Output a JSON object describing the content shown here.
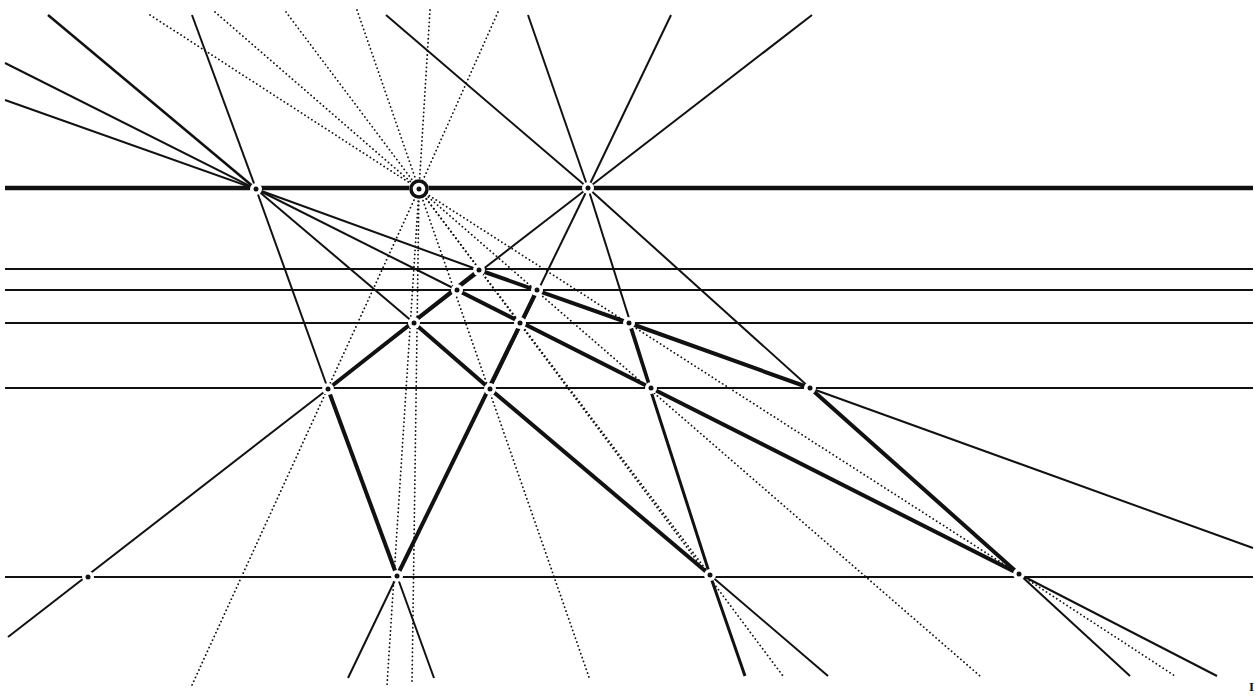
{
  "diagram": {
    "stroke_color": "#111111",
    "background": "#ffffff",
    "corner_mark": "I",
    "horizontals": [
      {
        "y": 188,
        "x1": 5,
        "x2": 1253,
        "w": 4.5
      },
      {
        "y": 269,
        "x1": 5,
        "x2": 1253,
        "w": 2
      },
      {
        "y": 290,
        "x1": 5,
        "x2": 1253,
        "w": 2
      },
      {
        "y": 323,
        "x1": 5,
        "x2": 1253,
        "w": 2
      },
      {
        "y": 388,
        "x1": 5,
        "x2": 1253,
        "w": 2
      },
      {
        "y": 577,
        "x1": 5,
        "x2": 1253,
        "w": 2
      }
    ],
    "points": [
      {
        "name": "vp-left",
        "x": 256,
        "y": 189
      },
      {
        "name": "vp-center",
        "x": 419,
        "y": 189,
        "ring": true
      },
      {
        "name": "vp-right",
        "x": 588,
        "y": 188
      },
      {
        "name": "p1",
        "x": 479,
        "y": 270
      },
      {
        "name": "p2",
        "x": 537,
        "y": 290
      },
      {
        "name": "p3",
        "x": 457,
        "y": 290
      },
      {
        "name": "p4",
        "x": 414,
        "y": 323
      },
      {
        "name": "p5",
        "x": 520,
        "y": 323
      },
      {
        "name": "p6",
        "x": 629,
        "y": 323
      },
      {
        "name": "p7",
        "x": 328,
        "y": 389
      },
      {
        "name": "p8",
        "x": 490,
        "y": 389
      },
      {
        "name": "p9",
        "x": 651,
        "y": 388
      },
      {
        "name": "p10",
        "x": 810,
        "y": 388
      },
      {
        "name": "b1",
        "x": 88,
        "y": 577
      },
      {
        "name": "b2",
        "x": 397,
        "y": 576
      },
      {
        "name": "b3",
        "x": 710,
        "y": 575
      },
      {
        "name": "b4",
        "x": 1019,
        "y": 574
      }
    ],
    "solid_lines": [
      {
        "x1": 48,
        "y1": 15,
        "x2": 256,
        "y2": 189,
        "w": 2.5
      },
      {
        "x1": 5,
        "y1": 63,
        "x2": 256,
        "y2": 189,
        "w": 2
      },
      {
        "x1": 5,
        "y1": 100,
        "x2": 256,
        "y2": 189,
        "w": 2
      },
      {
        "x1": 192,
        "y1": 15,
        "x2": 256,
        "y2": 189,
        "w": 2
      },
      {
        "x1": 256,
        "y1": 189,
        "x2": 479,
        "y2": 270,
        "w": 2
      },
      {
        "x1": 256,
        "y1": 189,
        "x2": 457,
        "y2": 290,
        "w": 2
      },
      {
        "x1": 256,
        "y1": 189,
        "x2": 414,
        "y2": 323,
        "w": 2
      },
      {
        "x1": 256,
        "y1": 189,
        "x2": 328,
        "y2": 389,
        "w": 2
      },
      {
        "x1": 386,
        "y1": 15,
        "x2": 588,
        "y2": 188,
        "w": 2
      },
      {
        "x1": 528,
        "y1": 15,
        "x2": 588,
        "y2": 188,
        "w": 2
      },
      {
        "x1": 671,
        "y1": 15,
        "x2": 588,
        "y2": 188,
        "w": 2
      },
      {
        "x1": 812,
        "y1": 15,
        "x2": 588,
        "y2": 188,
        "w": 2
      },
      {
        "x1": 588,
        "y1": 188,
        "x2": 328,
        "y2": 389,
        "w": 2
      },
      {
        "x1": 588,
        "y1": 188,
        "x2": 490,
        "y2": 389,
        "w": 2
      },
      {
        "x1": 588,
        "y1": 188,
        "x2": 651,
        "y2": 388,
        "w": 2
      },
      {
        "x1": 588,
        "y1": 188,
        "x2": 810,
        "y2": 388,
        "w": 2
      },
      {
        "x1": 479,
        "y1": 270,
        "x2": 629,
        "y2": 323,
        "w": 4
      },
      {
        "x1": 629,
        "y1": 323,
        "x2": 810,
        "y2": 388,
        "w": 4
      },
      {
        "x1": 457,
        "y1": 290,
        "x2": 651,
        "y2": 388,
        "w": 4
      },
      {
        "x1": 414,
        "y1": 323,
        "x2": 490,
        "y2": 389,
        "w": 4
      },
      {
        "x1": 490,
        "y1": 389,
        "x2": 710,
        "y2": 575,
        "w": 4
      },
      {
        "x1": 651,
        "y1": 388,
        "x2": 1019,
        "y2": 574,
        "w": 4
      },
      {
        "x1": 810,
        "y1": 388,
        "x2": 1019,
        "y2": 574,
        "w": 4
      },
      {
        "x1": 629,
        "y1": 323,
        "x2": 710,
        "y2": 575,
        "w": 3
      },
      {
        "x1": 479,
        "y1": 270,
        "x2": 328,
        "y2": 389,
        "w": 4
      },
      {
        "x1": 537,
        "y1": 290,
        "x2": 397,
        "y2": 576,
        "w": 4
      },
      {
        "x1": 328,
        "y1": 389,
        "x2": 397,
        "y2": 576,
        "w": 4
      },
      {
        "x1": 328,
        "y1": 389,
        "x2": 8,
        "y2": 637,
        "w": 2
      },
      {
        "x1": 810,
        "y1": 388,
        "x2": 1253,
        "y2": 548,
        "w": 2
      },
      {
        "x1": 397,
        "y1": 576,
        "x2": 348,
        "y2": 678,
        "w": 2
      },
      {
        "x1": 397,
        "y1": 576,
        "x2": 434,
        "y2": 678,
        "w": 2
      },
      {
        "x1": 710,
        "y1": 575,
        "x2": 745,
        "y2": 676,
        "w": 3
      },
      {
        "x1": 710,
        "y1": 575,
        "x2": 828,
        "y2": 676,
        "w": 2
      },
      {
        "x1": 1019,
        "y1": 574,
        "x2": 1130,
        "y2": 676,
        "w": 2
      },
      {
        "x1": 1019,
        "y1": 574,
        "x2": 1217,
        "y2": 676,
        "w": 2
      }
    ],
    "dotted_lines": [
      {
        "x1": 150,
        "y1": 15,
        "x2": 419,
        "y2": 189
      },
      {
        "x1": 215,
        "y1": 12,
        "x2": 419,
        "y2": 189
      },
      {
        "x1": 286,
        "y1": 12,
        "x2": 419,
        "y2": 189
      },
      {
        "x1": 357,
        "y1": 10,
        "x2": 419,
        "y2": 189
      },
      {
        "x1": 430,
        "y1": 10,
        "x2": 419,
        "y2": 189
      },
      {
        "x1": 498,
        "y1": 12,
        "x2": 419,
        "y2": 189
      },
      {
        "x1": 419,
        "y1": 189,
        "x2": 192,
        "y2": 685
      },
      {
        "x1": 419,
        "y1": 189,
        "x2": 387,
        "y2": 685
      },
      {
        "x1": 419,
        "y1": 189,
        "x2": 412,
        "y2": 685
      },
      {
        "x1": 419,
        "y1": 189,
        "x2": 590,
        "y2": 680
      },
      {
        "x1": 419,
        "y1": 189,
        "x2": 783,
        "y2": 676
      },
      {
        "x1": 419,
        "y1": 189,
        "x2": 980,
        "y2": 676
      },
      {
        "x1": 419,
        "y1": 189,
        "x2": 1019,
        "y2": 574
      },
      {
        "x1": 419,
        "y1": 189,
        "x2": 710,
        "y2": 575
      },
      {
        "x1": 1019,
        "y1": 574,
        "x2": 1175,
        "y2": 676
      }
    ]
  }
}
